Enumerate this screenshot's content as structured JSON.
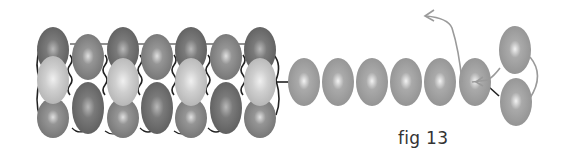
{
  "figure": {
    "caption": "fig 13",
    "colors": {
      "bead_dark": "#6e6e6e",
      "bead_medium": "#8c8c8c",
      "bead_light": "#c4c4c4",
      "strand_bead": "#a0a0a0",
      "thread_dark": "#222222",
      "thread_gray": "#9a9a9a"
    },
    "tube": {
      "columns": [
        {
          "x": 53,
          "type": "odd"
        },
        {
          "x": 88,
          "type": "even"
        },
        {
          "x": 123,
          "type": "odd"
        },
        {
          "x": 157,
          "type": "even"
        },
        {
          "x": 191,
          "type": "odd"
        },
        {
          "x": 226,
          "type": "even"
        },
        {
          "x": 260,
          "type": "odd"
        }
      ]
    },
    "strand": {
      "beads_x": [
        304,
        338,
        372,
        406,
        440,
        475
      ],
      "y": 82
    },
    "end_beads": [
      {
        "x": 515,
        "y": 50
      },
      {
        "x": 516,
        "y": 102
      }
    ]
  }
}
